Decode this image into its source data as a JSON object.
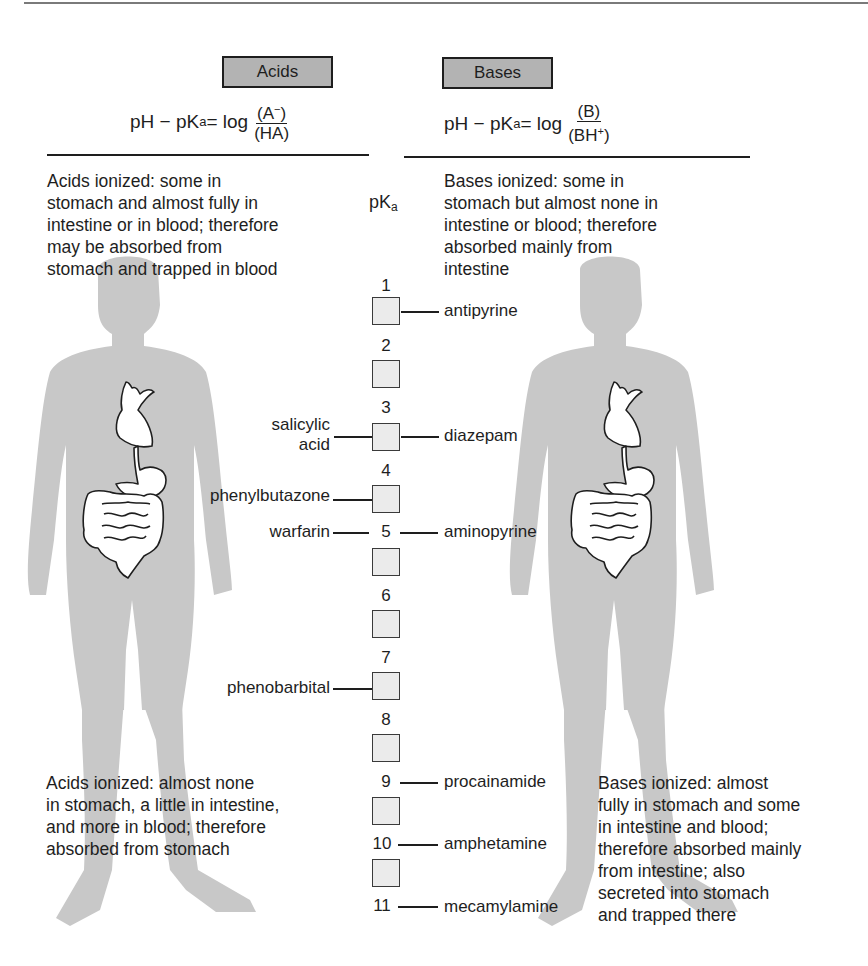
{
  "header": {
    "acids": {
      "label": "Acids",
      "equation_lhs": "pH − pK",
      "equation_sub": "a",
      "equation_mid": " = log",
      "numerator": "(A",
      "numerator_sup": "−",
      "numerator_end": ")",
      "denominator": "(HA)"
    },
    "bases": {
      "label": "Bases",
      "equation_lhs": "pH − pK",
      "equation_sub": "a",
      "equation_mid": " = log",
      "numerator": "(B)",
      "denominator": "(BH",
      "denominator_sup": "+",
      "denominator_end": ")"
    }
  },
  "pka_axis": {
    "title": "pK",
    "title_sub": "a",
    "ticks": [
      "1",
      "2",
      "3",
      "4",
      "5",
      "6",
      "7",
      "8",
      "9",
      "10",
      "11"
    ]
  },
  "descriptions": {
    "acids_low_pka": "Acids ionized: some in\nstomach and almost fully in\nintestine or in blood; therefore\nmay be absorbed from\nstomach and trapped in blood",
    "bases_low_pka": "Bases ionized: some in\nstomach but almost none in\nintestine or blood; therefore\nabsorbed mainly from\nintestine",
    "acids_high_pka": "Acids ionized: almost none\nin stomach, a little in intestine,\nand more in blood; therefore\nabsorbed from stomach",
    "bases_high_pka": "Bases ionized: almost\nfully in stomach and some\nin intestine and blood;\ntherefore absorbed mainly\nfrom intestine; also\nsecreted into stomach\nand trapped there"
  },
  "acid_drugs": [
    {
      "name": "salicylic\nacid",
      "pka": 3.0
    },
    {
      "name": "phenylbutazone",
      "pka": 4.5
    },
    {
      "name": "warfarin",
      "pka": 5.0
    },
    {
      "name": "phenobarbital",
      "pka": 7.4
    }
  ],
  "base_drugs": [
    {
      "name": "antipyrine",
      "pka": 1.4
    },
    {
      "name": "diazepam",
      "pka": 3.3
    },
    {
      "name": "aminopyrine",
      "pka": 5.0
    },
    {
      "name": "procainamide",
      "pka": 9.2
    },
    {
      "name": "amphetamine",
      "pka": 9.8
    },
    {
      "name": "mecamylamine",
      "pka": 11.2
    }
  ],
  "colors": {
    "silhouette": "#c8c8c8",
    "header_box": "#b3b3b3",
    "scale_box": "#ebebeb",
    "ink": "#1e1e1e"
  }
}
